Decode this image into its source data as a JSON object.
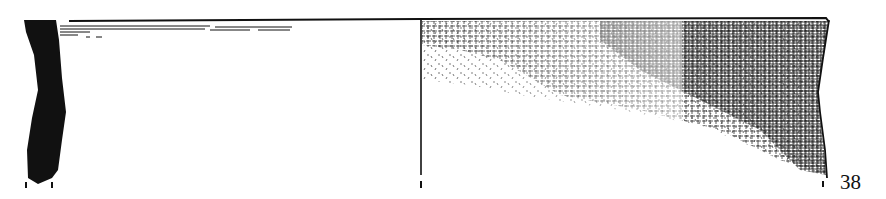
{
  "figure": {
    "number": "38",
    "parts": {
      "section": "black filled wall cross-section at left",
      "interior": "interior surface, plain with light horizontal rim lines",
      "exterior": "exterior surface with dense cross-hatched texture fading downward",
      "centerline": "vertical axis line dividing interior and exterior views"
    }
  },
  "colors": {
    "ink": "#111111",
    "paper": "#ffffff"
  }
}
